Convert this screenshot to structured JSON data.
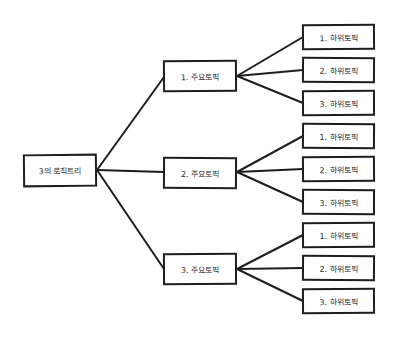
{
  "diagram": {
    "type": "logic-tree",
    "line_color": "#1e1e1e",
    "root": {
      "label": "3의 로직트리"
    },
    "topics": [
      {
        "label": "1. 주요토픽",
        "subtopics": [
          {
            "label": "1. 하위토픽"
          },
          {
            "label": "2. 하위토픽"
          },
          {
            "label": "3. 하위토픽"
          }
        ]
      },
      {
        "label": "2. 주요토픽",
        "subtopics": [
          {
            "label": "1. 하위토픽"
          },
          {
            "label": "2. 하위토픽"
          },
          {
            "label": "3. 하위토픽"
          }
        ]
      },
      {
        "label": "3. 주요토픽",
        "subtopics": [
          {
            "label": "1. 하위토픽"
          },
          {
            "label": "2. 하위토픽"
          },
          {
            "label": "3. 하위토픽"
          }
        ]
      }
    ]
  }
}
